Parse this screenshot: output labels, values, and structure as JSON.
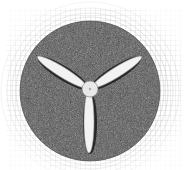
{
  "figure": {
    "width": 187,
    "height": 170,
    "background_color": "#ffffff",
    "outer_grid": {
      "type": "structured polar/cartesian grid",
      "line_color": "#b8b8b8",
      "extent": [
        8,
        10,
        180,
        168
      ]
    },
    "rotating_domain": {
      "type": "unstructured dense mesh",
      "center": [
        90,
        91
      ],
      "radius": 70,
      "fill_color": "#5a5a5a"
    },
    "hub": {
      "center": [
        90,
        89
      ],
      "radius": 7,
      "fill_color": "#e8e8e8"
    },
    "blades": [
      {
        "name": "upper-left",
        "tip": [
          37,
          58
        ],
        "angle_deg": 210
      },
      {
        "name": "upper-right",
        "tip": [
          142,
          57
        ],
        "angle_deg": 330
      },
      {
        "name": "bottom",
        "tip": [
          89,
          153
        ],
        "angle_deg": 90
      }
    ],
    "blade_color": "#f2f2f2",
    "blade_shadow_color": "#1a1a1a"
  }
}
